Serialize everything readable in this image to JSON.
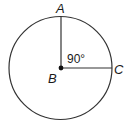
{
  "diagram": {
    "type": "circle-with-central-angle",
    "circle": {
      "cx": 61,
      "cy": 68,
      "r": 51.5,
      "stroke": "#333333"
    },
    "center_point": {
      "label": "B",
      "x": 61,
      "y": 68
    },
    "points": [
      {
        "label": "A",
        "x": 61,
        "y": 16.5
      },
      {
        "label": "C",
        "x": 112.5,
        "y": 68
      }
    ],
    "radii": [
      {
        "from": "B",
        "to": "A"
      },
      {
        "from": "B",
        "to": "C"
      }
    ],
    "angle": {
      "vertex": "B",
      "between": [
        "A",
        "C"
      ],
      "label": "90°"
    }
  },
  "labels": {
    "a": "A",
    "b": "B",
    "c": "C",
    "angle": "90°"
  }
}
